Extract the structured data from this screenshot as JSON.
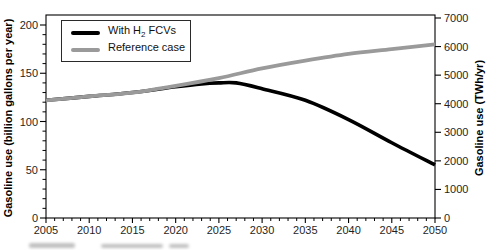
{
  "chart_data": {
    "type": "line",
    "title": "",
    "xlabel": "",
    "xlim": [
      2005,
      2050
    ],
    "x_ticks_major": [
      2005,
      2010,
      2015,
      2020,
      2025,
      2030,
      2035,
      2040,
      2045,
      2050
    ],
    "x_minor_step": 1,
    "grid": "off",
    "left_axis": {
      "label": "Gasoline use (billion gallons per year)",
      "lim": [
        0,
        200
      ],
      "ticks": [
        0,
        50,
        100,
        150,
        200
      ],
      "minor_step": 10
    },
    "right_axis": {
      "label": "Gasoline use (TWh/yr)",
      "lim": [
        0,
        7000
      ],
      "ticks": [
        0,
        1000,
        2000,
        3000,
        4000,
        5000,
        6000,
        7000
      ]
    },
    "legend": {
      "position": "top-left",
      "entries": [
        {
          "id": "with-h2-fcvs",
          "pre": "With H",
          "sub": "2",
          "post": " FCVs",
          "color": "#000000"
        },
        {
          "id": "reference-case",
          "pre": "Reference case",
          "sub": "",
          "post": "",
          "color": "#9a9a9a"
        }
      ]
    },
    "series": [
      {
        "name": "With H₂ FCVs",
        "color": "#000000",
        "width": 3.6,
        "points": [
          [
            2005,
            122
          ],
          [
            2010,
            126
          ],
          [
            2015,
            130
          ],
          [
            2020,
            136
          ],
          [
            2023,
            139
          ],
          [
            2025,
            140
          ],
          [
            2027,
            140
          ],
          [
            2030,
            134
          ],
          [
            2035,
            122
          ],
          [
            2040,
            102
          ],
          [
            2045,
            78
          ],
          [
            2050,
            55
          ]
        ]
      },
      {
        "name": "Reference case",
        "color": "#9a9a9a",
        "width": 3.8,
        "points": [
          [
            2005,
            122
          ],
          [
            2010,
            126
          ],
          [
            2015,
            130
          ],
          [
            2020,
            137
          ],
          [
            2025,
            145
          ],
          [
            2030,
            155
          ],
          [
            2035,
            163
          ],
          [
            2040,
            170
          ],
          [
            2045,
            175
          ],
          [
            2050,
            180
          ]
        ]
      }
    ],
    "units_note_left": "billion gallons per year",
    "units_note_right": "TWh/yr"
  },
  "colors": {
    "frame": "#000000",
    "tick_text": "#1f1f1f",
    "background": "#ffffff"
  }
}
